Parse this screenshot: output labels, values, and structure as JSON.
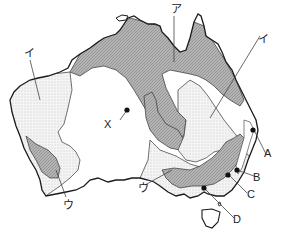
{
  "map": {
    "title": "Australia vegetation/climate zone map",
    "colors": {
      "outline": "#1a1a1a",
      "hatched_zone": "#a9a9a9",
      "dotted_zone": "#e8e8e8",
      "plain_zone": "#ffffff",
      "leader_line": "#444444"
    },
    "zones": [
      {
        "key": "a",
        "label": "ア",
        "pattern": "hatched"
      },
      {
        "key": "i",
        "label": "イ",
        "pattern": "dotted"
      },
      {
        "key": "u",
        "label": "ウ",
        "pattern": "hatched"
      }
    ],
    "labels": {
      "a": "ア",
      "i_west": "イ",
      "i_east": "イ",
      "u_west": "ウ",
      "u_south": "ウ",
      "x": "X",
      "A": "A",
      "B": "B",
      "C": "C",
      "D": "D"
    },
    "points": [
      {
        "id": "X",
        "x": 127,
        "y": 110
      },
      {
        "id": "A",
        "x": 253,
        "y": 130
      },
      {
        "id": "B",
        "x": 237,
        "y": 170
      },
      {
        "id": "C",
        "x": 228,
        "y": 175
      },
      {
        "id": "D",
        "x": 204,
        "y": 188
      }
    ]
  }
}
